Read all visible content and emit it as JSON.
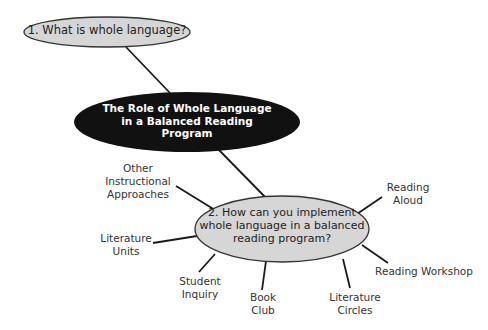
{
  "diagram": {
    "type": "concept-map",
    "colors": {
      "background": "#ffffff",
      "question_fill": "#d6d6d6",
      "question_stroke": "#333333",
      "main_fill": "#111111",
      "main_text": "#ffffff",
      "line": "#1a1a1a",
      "label_text": "#333333"
    },
    "main_node": {
      "lines": [
        "The Role of Whole Language",
        "in a Balanced Reading",
        "Program"
      ]
    },
    "question_1": {
      "lines": [
        "1.  What is whole language?"
      ]
    },
    "question_2": {
      "lines": [
        "2.  How can you implement",
        "whole language in a balanced",
        "reading program?"
      ]
    },
    "branches": [
      {
        "id": "other-instructional-approaches",
        "lines": [
          "Other",
          "Instructional",
          "Approaches"
        ]
      },
      {
        "id": "literature-units",
        "lines": [
          "Literature",
          "Units"
        ]
      },
      {
        "id": "student-inquiry",
        "lines": [
          "Student",
          "Inquiry"
        ]
      },
      {
        "id": "book-club",
        "lines": [
          "Book",
          "Club"
        ]
      },
      {
        "id": "literature-circles",
        "lines": [
          "Literature",
          "Circles"
        ]
      },
      {
        "id": "reading-aloud",
        "lines": [
          "Reading",
          "Aloud"
        ]
      },
      {
        "id": "reading-workshop",
        "lines": [
          "Reading Workshop"
        ]
      }
    ]
  }
}
